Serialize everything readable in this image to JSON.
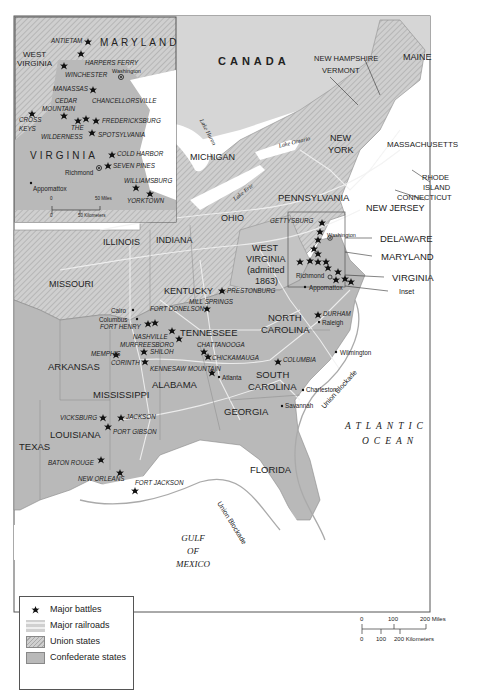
{
  "colors": {
    "union": "#c9c9c9",
    "confederate": "#b8b8b8",
    "foreign": "#d6d6d6",
    "water": "#ffffff",
    "railroad": "#f2f2f2",
    "border": "#555555"
  },
  "map": {
    "title_labels": {
      "canada": "CANADA",
      "atlantic": "ATLANTIC",
      "ocean": "OCEAN",
      "gulf_1": "GULF",
      "gulf_2": "OF",
      "gulf_3": "MEXICO",
      "union_blockade_atlantic": "Union Blockade",
      "union_blockade_gulf": "Union Blockade"
    },
    "lakes": {
      "huron": "Lake Huron",
      "ontario": "Lake Ontario",
      "erie": "Lake Erie"
    },
    "states": {
      "maine": "MAINE",
      "new_hampshire": "NEW HAMPSHIRE",
      "vermont": "VERMONT",
      "new_york": "NEW",
      "new_york_2": "YORK",
      "massachusetts": "MASSACHUSETTS",
      "rhode_island": "RHODE",
      "rhode_island_2": "ISLAND",
      "connecticut": "CONNECTICUT",
      "new_jersey": "NEW JERSEY",
      "pennsylvania": "PENNSYLVANIA",
      "michigan": "MICHIGAN",
      "ohio": "OHIO",
      "indiana": "INDIANA",
      "illinois": "ILLINOIS",
      "missouri": "MISSOURI",
      "kentucky": "KENTUCKY",
      "west_virginia": "WEST",
      "west_virginia_2": "VIRGINIA",
      "west_virginia_3": "(admitted",
      "west_virginia_4": "1863)",
      "delaware": "DELAWARE",
      "maryland": "MARYLAND",
      "virginia": "VIRGINIA",
      "inset": "Inset",
      "tennessee": "TENNESSEE",
      "north_carolina": "NORTH",
      "north_carolina_2": "CAROLINA",
      "south_carolina": "SOUTH",
      "south_carolina_2": "CAROLINA",
      "arkansas": "ARKANSAS",
      "mississippi": "MISSISSIPPI",
      "alabama": "ALABAMA",
      "georgia": "GEORGIA",
      "louisiana": "LOUISIANA",
      "texas": "TEXAS",
      "florida": "FLORIDA"
    },
    "battles": [
      {
        "name": "GETTYSBURG",
        "x": 322,
        "y": 223
      },
      {
        "name": "PRESTONBURG",
        "x": 222,
        "y": 291
      },
      {
        "name": "MILL SPRINGS",
        "x": 207,
        "y": 309
      },
      {
        "name": "FORT DONELSON",
        "x": 155,
        "y": 325
      },
      {
        "name": "FORT HENRY",
        "x": 149,
        "y": 324
      },
      {
        "name": "NASHVILLE",
        "x": 174,
        "y": 330
      },
      {
        "name": "MURFREESBORO",
        "x": 179,
        "y": 339
      },
      {
        "name": "SHILOH",
        "x": 144,
        "y": 352
      },
      {
        "name": "CORINTH",
        "x": 145,
        "y": 362
      },
      {
        "name": "MEMPHIS",
        "x": 116,
        "y": 355
      },
      {
        "name": "CHATTANOOGA",
        "x": 204,
        "y": 352
      },
      {
        "name": "CHICKAMAUGA",
        "x": 208,
        "y": 357
      },
      {
        "name": "KENNESAW MOUNTAIN",
        "x": 212,
        "y": 373
      },
      {
        "name": "COLUMBIA",
        "x": 278,
        "y": 362
      },
      {
        "name": "DURHAM",
        "x": 318,
        "y": 315
      },
      {
        "name": "VICKSBURG",
        "x": 103,
        "y": 418
      },
      {
        "name": "JACKSON",
        "x": 121,
        "y": 418
      },
      {
        "name": "PORT GIBSON",
        "x": 108,
        "y": 427
      },
      {
        "name": "BATON ROUGE",
        "x": 101,
        "y": 460
      },
      {
        "name": "NEW ORLEANS",
        "x": 120,
        "y": 473
      },
      {
        "name": "FORT JACKSON",
        "x": 135,
        "y": 491
      }
    ],
    "cities": {
      "washington": "Washington",
      "richmond": "Richmond",
      "appomattox": "Appomattox",
      "raleigh": "Raleigh",
      "wilmington": "Wilmington",
      "charleston": "Charleston",
      "savannah": "Savannah",
      "atlanta": "Atlanta",
      "cairo": "Cairo",
      "columbus": "Columbus"
    }
  },
  "inset": {
    "states": {
      "maryland": "MARYLAND",
      "west_virginia": "WEST",
      "west_virginia_2": "VIRGINIA",
      "virginia": "VIRGINIA"
    },
    "battles": {
      "antietam": "ANTIETAM",
      "harpers_ferry": "HARPERS FERRY",
      "winchester": "WINCHESTER",
      "manassas": "MANASSAS",
      "cedar_mountain": "CEDAR",
      "cedar_mountain_2": "MOUNTAIN",
      "chancellorsville": "CHANCELLORSVILLE",
      "cross_keys": "CROSS",
      "cross_keys_2": "KEYS",
      "fredericksburg": "FREDERICKSBURG",
      "wilderness": "THE",
      "wilderness_2": "WILDERNESS",
      "spotsylvania": "SPOTSYLVANIA",
      "cold_harbor": "COLD HARBOR",
      "seven_pines": "SEVEN PINES",
      "williamsburg": "WILLIAMSBURG",
      "yorktown": "YORKTOWN"
    },
    "cities": {
      "washington": "Washington",
      "richmond": "Richmond",
      "appomattox": "Appomattox"
    },
    "scale": {
      "zero_top": "0",
      "miles": "50 Miles",
      "zero_bottom": "0",
      "km": "50 Kilometers"
    }
  },
  "legend": {
    "items": [
      {
        "label": "Major battles",
        "swatch": "star"
      },
      {
        "label": "Major railroads",
        "swatch": "railroad"
      },
      {
        "label": "Union states",
        "swatch": "hatch"
      },
      {
        "label": "Confederate states",
        "swatch": "gray"
      }
    ]
  },
  "scale_bar": {
    "m0": "0",
    "m100": "100",
    "m200": "200 Miles",
    "k0": "0",
    "k100": "100",
    "k200": "200 Kilometers"
  }
}
